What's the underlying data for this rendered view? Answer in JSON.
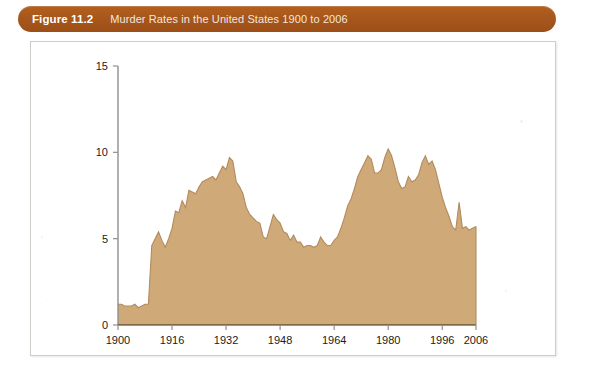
{
  "figure": {
    "label": "Figure 11.2",
    "title": "Murder Rates in the United States 1900 to 2006"
  },
  "colors": {
    "caption_bar": "#a8571c",
    "caption_label_text": "#ffffff",
    "caption_title_text": "#f2e7dd",
    "area_fill": "#cfa978",
    "area_outline": "#b18b5d",
    "axis": "#8f8f8f",
    "xaxis": "#3b2a18",
    "card_border": "#cfcbc7",
    "card_background": "#ffffff"
  },
  "chart_data": {
    "type": "area",
    "title": "Murder Rates in the United States 1900 to 2006",
    "xlabel": "",
    "ylabel": "",
    "xlim": [
      1900,
      2006
    ],
    "ylim": [
      0,
      15
    ],
    "grid": false,
    "legend": null,
    "x_ticks": [
      "1900",
      "1916",
      "1932",
      "1948",
      "1964",
      "1980",
      "1996",
      "2006"
    ],
    "x_tick_values": [
      1900,
      1916,
      1932,
      1948,
      1964,
      1980,
      1996,
      2006
    ],
    "y_ticks": [
      "0",
      "5",
      "10",
      "15"
    ],
    "y_tick_values": [
      0,
      5,
      10,
      15
    ],
    "series_name": "Murder rate per 100,000",
    "x": [
      1900,
      1901,
      1902,
      1903,
      1904,
      1905,
      1906,
      1907,
      1908,
      1909,
      1910,
      1911,
      1912,
      1913,
      1914,
      1915,
      1916,
      1917,
      1918,
      1919,
      1920,
      1921,
      1922,
      1923,
      1924,
      1925,
      1926,
      1927,
      1928,
      1929,
      1930,
      1931,
      1932,
      1933,
      1934,
      1935,
      1936,
      1937,
      1938,
      1939,
      1940,
      1941,
      1942,
      1943,
      1944,
      1945,
      1946,
      1947,
      1948,
      1949,
      1950,
      1951,
      1952,
      1953,
      1954,
      1955,
      1956,
      1957,
      1958,
      1959,
      1960,
      1961,
      1962,
      1963,
      1964,
      1965,
      1966,
      1967,
      1968,
      1969,
      1970,
      1971,
      1972,
      1973,
      1974,
      1975,
      1976,
      1977,
      1978,
      1979,
      1980,
      1981,
      1982,
      1983,
      1984,
      1985,
      1986,
      1987,
      1988,
      1989,
      1990,
      1991,
      1992,
      1993,
      1994,
      1995,
      1996,
      1997,
      1998,
      1999,
      2000,
      2001,
      2002,
      2003,
      2004,
      2005,
      2006
    ],
    "values": [
      1.2,
      1.2,
      1.1,
      1.1,
      1.1,
      1.2,
      1.0,
      1.1,
      1.2,
      1.2,
      4.6,
      5.0,
      5.4,
      4.9,
      4.5,
      5.0,
      5.6,
      6.6,
      6.5,
      7.2,
      6.8,
      7.8,
      7.7,
      7.6,
      8.0,
      8.3,
      8.4,
      8.5,
      8.6,
      8.4,
      8.8,
      9.2,
      9.0,
      9.7,
      9.5,
      8.3,
      8.0,
      7.6,
      6.8,
      6.4,
      6.2,
      6.0,
      5.9,
      5.1,
      5.0,
      5.7,
      6.4,
      6.1,
      5.9,
      5.4,
      5.3,
      4.9,
      5.2,
      4.8,
      4.8,
      4.5,
      4.6,
      4.6,
      4.5,
      4.6,
      5.1,
      4.8,
      4.6,
      4.6,
      4.9,
      5.1,
      5.6,
      6.2,
      6.9,
      7.3,
      7.9,
      8.6,
      9.0,
      9.4,
      9.8,
      9.6,
      8.8,
      8.8,
      9.0,
      9.7,
      10.2,
      9.8,
      9.1,
      8.3,
      7.9,
      8.0,
      8.6,
      8.3,
      8.4,
      8.7,
      9.4,
      9.8,
      9.3,
      9.5,
      9.0,
      8.2,
      7.4,
      6.8,
      6.3,
      5.7,
      5.5,
      7.1,
      5.6,
      5.7,
      5.5,
      5.6,
      5.7
    ],
    "annotations": []
  }
}
